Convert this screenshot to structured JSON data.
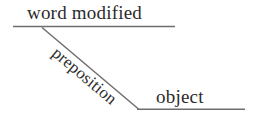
{
  "diagram": {
    "type": "reed-kellogg-sentence-diagram",
    "background_color": "#ffffff",
    "line_color": "#6e6e6e",
    "text_color": "#2b2b2b",
    "labels": {
      "modified_word": "word modified",
      "preposition": "preposition",
      "object": "object"
    },
    "lines": [
      {
        "name": "top-baseline",
        "orientation": "horizontal",
        "x1": 13,
        "y1": 26,
        "x2": 175,
        "y2": 26
      },
      {
        "name": "preposition-slant",
        "orientation": "diagonal",
        "x1": 42,
        "y1": 28,
        "x2": 138,
        "y2": 109
      },
      {
        "name": "object-baseline",
        "orientation": "horizontal",
        "x1": 137,
        "y1": 109,
        "x2": 245,
        "y2": 109
      }
    ],
    "preposition_rotation_deg": 40.2
  }
}
